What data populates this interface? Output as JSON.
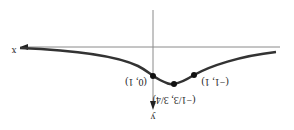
{
  "figure": {
    "orientation": "rotated-180",
    "axes": {
      "x_label": "x",
      "y_label": "y",
      "x_axis_color": "#8a8a8a",
      "y_axis_color": "#8a8a8a",
      "curve_color": "#333333"
    },
    "points": [
      {
        "label": "(0, 1)",
        "px": 153,
        "py": 76
      },
      {
        "label": "(−1/3, 3/4)",
        "px": 174,
        "py": 84
      },
      {
        "label": "(−1, 1)",
        "px": 194,
        "py": 75
      }
    ],
    "curve_description": "bell-shaped curve with local extremum between (0,1) and (−1,1), approaching x-axis asymptotically on both sides"
  }
}
